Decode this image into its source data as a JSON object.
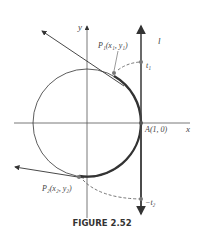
{
  "figure": {
    "caption": "FIGURE 2.52",
    "labels": {
      "y_axis": "y",
      "x_axis": "x",
      "line": "l",
      "p1": "P₁(x₁, y₁)",
      "t1": "t₁",
      "a": "A(1, 0)",
      "p2": "P₂(x₂, y₂)",
      "t2": "−t₂"
    }
  }
}
